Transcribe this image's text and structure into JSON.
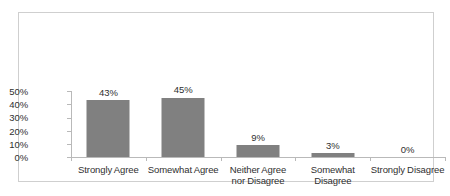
{
  "chart_data": {
    "type": "bar",
    "title": "",
    "subtitle": "",
    "xlabel": "",
    "ylabel": "",
    "categories": [
      "Strongly Agree",
      "Somewhat Agree",
      "Neither Agree nor Disagree",
      "Somewhat Disagree",
      "Strongly Disagree"
    ],
    "values": [
      43,
      45,
      9,
      3,
      0
    ],
    "value_labels": [
      "43%",
      "45%",
      "9%",
      "3%",
      "0%"
    ],
    "ylim": [
      0,
      50
    ],
    "ytick_values": [
      0,
      10,
      20,
      30,
      40,
      50
    ],
    "ytick_labels": [
      "0%",
      "10%",
      "20%",
      "30%",
      "40%",
      "50%"
    ],
    "grid": false,
    "legend": false,
    "legend_position": "none",
    "bar_color": "#808080",
    "axis_color": "#b9b9b9",
    "text_color": "#2f2f2f",
    "border_color": "#cfcfcf",
    "background_color": "#ffffff"
  }
}
